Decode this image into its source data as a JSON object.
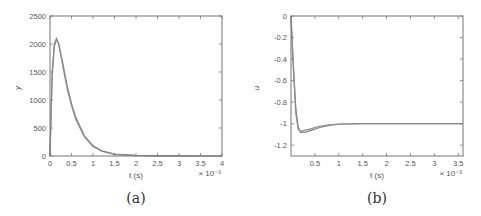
{
  "chart_data": [
    {
      "type": "line",
      "panel": "(a)",
      "title": "",
      "xlabel": "t (s)",
      "ylabel": "y",
      "x_multiplier": "× 10⁻⁵",
      "xlim": [
        0,
        4
      ],
      "ylim": [
        0,
        2500
      ],
      "xticks": [
        0,
        0.5,
        1,
        1.5,
        2,
        2.5,
        3,
        3.5,
        4
      ],
      "xtick_labels": [
        "0",
        "0.5",
        "1",
        "1.5",
        "2",
        "2.5",
        "3",
        "3.5",
        "4"
      ],
      "yticks": [
        0,
        500,
        1000,
        1500,
        2000,
        2500
      ],
      "ytick_labels": [
        "0",
        "500",
        "1000",
        "1500",
        "2000",
        "2500"
      ],
      "grid": false,
      "series": [
        {
          "name": "trace 1",
          "x": [
            0,
            0.05,
            0.1,
            0.15,
            0.2,
            0.3,
            0.4,
            0.5,
            0.6,
            0.8,
            1.0,
            1.2,
            1.5,
            2.0,
            2.5,
            3.0,
            3.5,
            4.0
          ],
          "y": [
            0,
            1500,
            2000,
            2100,
            2000,
            1600,
            1200,
            900,
            650,
            340,
            170,
            85,
            30,
            8,
            3,
            1,
            0,
            0
          ]
        },
        {
          "name": "trace 2",
          "x": [
            0,
            0.05,
            0.1,
            0.15,
            0.2,
            0.3,
            0.4,
            0.5,
            0.6,
            0.8,
            1.0,
            1.2,
            1.5,
            2.0,
            2.5,
            3.0,
            3.5,
            4.0
          ],
          "y": [
            0,
            1400,
            1950,
            2080,
            2020,
            1650,
            1250,
            940,
            690,
            360,
            185,
            95,
            35,
            10,
            4,
            1,
            0,
            0
          ]
        }
      ]
    },
    {
      "type": "line",
      "panel": "(b)",
      "title": "",
      "xlabel": "t (s)",
      "ylabel": "u",
      "x_multiplier": "× 10⁻⁵",
      "xlim": [
        0,
        3.6
      ],
      "ylim": [
        -1.3,
        0
      ],
      "xticks": [
        0.5,
        1,
        1.5,
        2,
        2.5,
        3,
        3.5
      ],
      "xtick_labels": [
        "0.5",
        "1",
        "1.5",
        "2",
        "2.5",
        "3",
        "3.5"
      ],
      "yticks": [
        0,
        -0.2,
        -0.4,
        -0.6,
        -0.8,
        -1,
        -1.2
      ],
      "ytick_labels": [
        "0",
        "-0.2",
        "-0.4",
        "-0.6",
        "-0.8",
        "-1",
        "-1.2"
      ],
      "grid": false,
      "series": [
        {
          "name": "trace 1",
          "x": [
            0,
            0.05,
            0.1,
            0.15,
            0.2,
            0.3,
            0.4,
            0.5,
            0.6,
            0.8,
            1.0,
            1.5,
            2.0,
            2.5,
            3.0,
            3.6
          ],
          "y": [
            0,
            -0.5,
            -0.9,
            -1.05,
            -1.07,
            -1.06,
            -1.05,
            -1.035,
            -1.025,
            -1.01,
            -1.003,
            -1.0,
            -1.0,
            -1.0,
            -1.0,
            -1.0
          ]
        },
        {
          "name": "trace 2",
          "x": [
            0,
            0.05,
            0.1,
            0.15,
            0.2,
            0.3,
            0.4,
            0.5,
            0.6,
            0.8,
            1.0,
            1.5,
            2.0,
            2.5,
            3.0,
            3.6
          ],
          "y": [
            0,
            -0.45,
            -0.85,
            -1.03,
            -1.08,
            -1.08,
            -1.065,
            -1.05,
            -1.035,
            -1.015,
            -1.005,
            -1.0,
            -1.0,
            -1.0,
            -1.0,
            -1.0
          ]
        }
      ]
    }
  ],
  "panels": {
    "a": {
      "caption": "(a)",
      "xlabel": "t (s)",
      "ylabel": "y",
      "multiplier": "× 10⁻⁵"
    },
    "b": {
      "caption": "(b)",
      "xlabel": "t (s)",
      "ylabel": "u",
      "multiplier": "× 10⁻⁵"
    }
  },
  "colors": {
    "curve": "#8a8a8a",
    "frame": "#777777",
    "text": "#555555"
  }
}
